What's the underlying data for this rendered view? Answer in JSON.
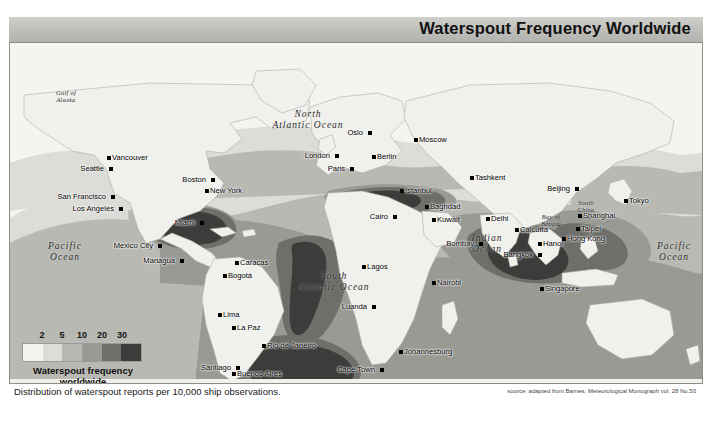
{
  "title": "Waterspout Frequency Worldwide",
  "caption": "Distribution of waterspout reports per 10,000 ship observations.",
  "source": "source: adapted from Barnes, Meteorological Monograph vol. 28 No.50",
  "legend": {
    "title_line1": "Waterspout frequency",
    "title_line2": "worldwide",
    "ticks": [
      "2",
      "5",
      "10",
      "20",
      "30"
    ],
    "swatches": [
      "#f4f4f1",
      "#dcdcd8",
      "#b9b9b4",
      "#9a9a95",
      "#6e6e6a",
      "#3c3c3a"
    ]
  },
  "chart_data": {
    "type": "heatmap",
    "title": "Waterspout Frequency Worldwide",
    "subtitle": "Distribution of waterspout reports per 10,000 ship observations.",
    "unit": "waterspout reports per 10,000 ship observations",
    "projection": "world map (equirectangular-like)",
    "legend_position": "bottom-left",
    "class_breaks": [
      2,
      5,
      10,
      20,
      30
    ],
    "class_colors": [
      "#f4f4f1",
      "#dcdcd8",
      "#b9b9b4",
      "#9a9a95",
      "#6e6e6a",
      "#3c3c3a"
    ],
    "class_labels": [
      "<2",
      "2-5",
      "5-10",
      "10-20",
      "20-30",
      ">30"
    ],
    "regions": [
      {
        "name": "Gulf of Mexico / Florida Straits",
        "class": ">30",
        "value": 35
      },
      {
        "name": "Bay of Bengal",
        "class": ">30",
        "value": 32
      },
      {
        "name": "South Atlantic off Brazil",
        "class": ">30",
        "value": 31
      },
      {
        "name": "South Atlantic south of Buenos Aires",
        "class": ">30",
        "value": 30
      },
      {
        "name": "Mediterranean Sea (central)",
        "class": "20-30",
        "value": 24
      },
      {
        "name": "South China Sea",
        "class": "10-20",
        "value": 16
      },
      {
        "name": "Caribbean Sea",
        "class": "10-20",
        "value": 15
      },
      {
        "name": "Arabian Sea",
        "class": "10-20",
        "value": 14
      },
      {
        "name": "Indian Ocean (tropical)",
        "class": "10-20",
        "value": 12
      },
      {
        "name": "North Atlantic (subtropical)",
        "class": "5-10",
        "value": 8
      },
      {
        "name": "Eastern Pacific (tropical)",
        "class": "5-10",
        "value": 7
      },
      {
        "name": "Western Pacific (tropical)",
        "class": "5-10",
        "value": 7
      },
      {
        "name": "North Pacific (mid-latitude)",
        "class": "<2",
        "value": 1
      },
      {
        "name": "Gulf of Alaska",
        "class": "<2",
        "value": 1
      },
      {
        "name": "Southern Ocean",
        "class": "2-5",
        "value": 3
      }
    ]
  },
  "oceans": [
    {
      "name": "Pacific Ocean",
      "line1": "Pacific",
      "line2": "Ocean",
      "x": 55,
      "y": 210,
      "size": "big"
    },
    {
      "name": "Pacific Ocean East",
      "line1": "Pacific",
      "line2": "Ocean",
      "x": 664,
      "y": 210,
      "size": "big"
    },
    {
      "name": "North Atlantic Ocean",
      "line1": "North",
      "line2": "Atlantic Ocean",
      "x": 215,
      "y": 115,
      "size": "big"
    },
    {
      "name": "South Atlantic Ocean",
      "line1": "South",
      "line2": "Atlantic Ocean",
      "x": 312,
      "y": 270,
      "size": "big"
    },
    {
      "name": "Indian Ocean",
      "line1": "Indian",
      "line2": "Ocean",
      "x": 478,
      "y": 240,
      "size": "big"
    },
    {
      "name": "Gulf of Alaska",
      "line1": "Gulf of",
      "line2": "Alaska",
      "x": 53,
      "y": 93,
      "size": "sm"
    },
    {
      "name": "Bay of Bengal",
      "line1": "Bay of",
      "line2": "Bengal",
      "x": 540,
      "y": 216,
      "size": "sm"
    },
    {
      "name": "South China Sea",
      "line1": "South",
      "line2": "China",
      "line3": "Sea",
      "x": 578,
      "y": 208,
      "size": "sm"
    }
  ],
  "cities": [
    {
      "name": "Vancouver",
      "x": 97,
      "y": 113,
      "side": "r"
    },
    {
      "name": "Seattle",
      "x": 99,
      "y": 124,
      "side": "l"
    },
    {
      "name": "San Francisco",
      "x": 101,
      "y": 152,
      "side": "l"
    },
    {
      "name": "Los Angeles",
      "x": 109,
      "y": 164,
      "side": "l"
    },
    {
      "name": "Mexico City",
      "x": 148,
      "y": 201,
      "side": "l"
    },
    {
      "name": "Managua",
      "x": 170,
      "y": 216,
      "side": "l"
    },
    {
      "name": "Miami",
      "x": 190,
      "y": 178,
      "side": "l"
    },
    {
      "name": "New York",
      "x": 195,
      "y": 146,
      "side": "r"
    },
    {
      "name": "Boston",
      "x": 201,
      "y": 135,
      "side": "l"
    },
    {
      "name": "Caracas",
      "x": 225,
      "y": 218,
      "side": "r"
    },
    {
      "name": "Bogotá",
      "x": 213,
      "y": 231,
      "side": "r"
    },
    {
      "name": "Lima",
      "x": 208,
      "y": 270,
      "side": "r"
    },
    {
      "name": "La Paz",
      "x": 222,
      "y": 283,
      "side": "r"
    },
    {
      "name": "Santiago",
      "x": 226,
      "y": 323,
      "side": "l"
    },
    {
      "name": "Buenos Aires",
      "x": 222,
      "y": 329,
      "side": "r"
    },
    {
      "name": "Rio de Janeiro",
      "x": 252,
      "y": 301,
      "side": "r"
    },
    {
      "name": "London",
      "x": 325,
      "y": 111,
      "side": "l"
    },
    {
      "name": "Oslo",
      "x": 358,
      "y": 88,
      "side": "l"
    },
    {
      "name": "Berlin",
      "x": 362,
      "y": 112,
      "side": "r"
    },
    {
      "name": "Paris",
      "x": 340,
      "y": 124,
      "side": "l"
    },
    {
      "name": "Moscow",
      "x": 404,
      "y": 95,
      "side": "r"
    },
    {
      "name": "Istanbul",
      "x": 390,
      "y": 146,
      "side": "r"
    },
    {
      "name": "Cairo",
      "x": 383,
      "y": 172,
      "side": "l"
    },
    {
      "name": "Baghdad",
      "x": 415,
      "y": 162,
      "side": "r"
    },
    {
      "name": "Kuwait",
      "x": 422,
      "y": 175,
      "side": "r"
    },
    {
      "name": "Tashkent",
      "x": 460,
      "y": 133,
      "side": "r"
    },
    {
      "name": "Delhi",
      "x": 476,
      "y": 174,
      "side": "r"
    },
    {
      "name": "Bombay",
      "x": 469,
      "y": 199,
      "side": "l"
    },
    {
      "name": "Calcutta",
      "x": 505,
      "y": 185,
      "side": "r"
    },
    {
      "name": "Bangkok",
      "x": 528,
      "y": 210,
      "side": "l"
    },
    {
      "name": "Hanoi",
      "x": 528,
      "y": 199,
      "side": "r"
    },
    {
      "name": "Singapore",
      "x": 530,
      "y": 244,
      "side": "r"
    },
    {
      "name": "Nairobi",
      "x": 422,
      "y": 238,
      "side": "r"
    },
    {
      "name": "Lagos",
      "x": 352,
      "y": 222,
      "side": "r"
    },
    {
      "name": "Luanda",
      "x": 362,
      "y": 262,
      "side": "l"
    },
    {
      "name": "Johannesburg",
      "x": 389,
      "y": 307,
      "side": "r"
    },
    {
      "name": "Cape Town",
      "x": 370,
      "y": 325,
      "side": "l"
    },
    {
      "name": "Beijing",
      "x": 565,
      "y": 144,
      "side": "l"
    },
    {
      "name": "Shanghai",
      "x": 568,
      "y": 171,
      "side": "r"
    },
    {
      "name": "Taipei",
      "x": 566,
      "y": 184,
      "side": "r"
    },
    {
      "name": "Hong Kong",
      "x": 552,
      "y": 194,
      "side": "r"
    },
    {
      "name": "Tokyo",
      "x": 614,
      "y": 156,
      "side": "r"
    }
  ]
}
